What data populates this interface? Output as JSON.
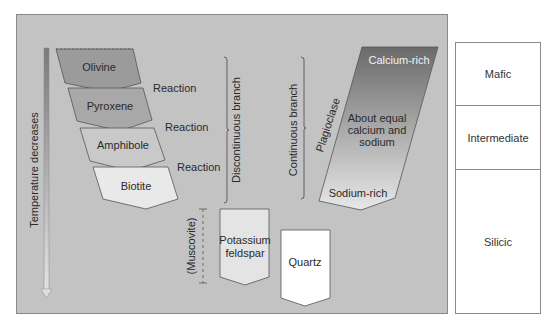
{
  "diagram": {
    "temperature_arrow": {
      "label": "Temperature decreases"
    },
    "discontinuous_branch": {
      "label": "Discontinuous branch",
      "minerals": [
        "Olivine",
        "Pyroxene",
        "Amphibole",
        "Biotite"
      ],
      "reactions": [
        "Reaction",
        "Reaction",
        "Reaction"
      ]
    },
    "continuous_branch": {
      "label": "Continuous branch",
      "mineral": "Plagioclase",
      "top_label": "Calcium-rich",
      "middle_label_line1": "About equal",
      "middle_label_line2": "calcium and",
      "middle_label_line3": "sodium",
      "bottom_label": "Sodium-rich"
    },
    "late_minerals": {
      "muscovite": "(Muscovite)",
      "kfeldspar_line1": "Potassium",
      "kfeldspar_line2": "feldspar",
      "quartz": "Quartz"
    },
    "colors": {
      "panel": "#c3c3c3",
      "olivine": "#9b9b9b",
      "pyroxene": "#a8a8a8",
      "amphibole": "#c9c9c9",
      "biotite": "#e9e9e9",
      "plagioclase_top": "#6e6e6e",
      "plagioclase_bottom": "#e6e6e6",
      "kfeldspar": "#e4e4e4",
      "quartz": "#ffffff"
    }
  },
  "composition_table": {
    "rows": [
      "Mafic",
      "Intermediate",
      "Silicic"
    ]
  }
}
